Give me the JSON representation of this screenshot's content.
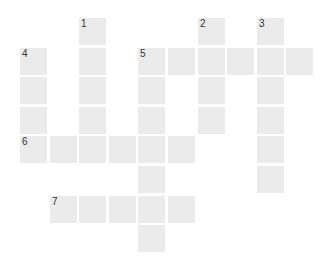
{
  "puzzle": {
    "type": "crossword",
    "origin": {
      "x": 20,
      "y": 18
    },
    "pitch": 29.6,
    "cell_color": "#ebebeb",
    "cells": [
      {
        "row": 0,
        "col": 2,
        "number": "1"
      },
      {
        "row": 0,
        "col": 6,
        "number": "2"
      },
      {
        "row": 0,
        "col": 8,
        "number": "3"
      },
      {
        "row": 1,
        "col": 0,
        "number": "4"
      },
      {
        "row": 1,
        "col": 2,
        "number": ""
      },
      {
        "row": 1,
        "col": 4,
        "number": "5"
      },
      {
        "row": 1,
        "col": 5,
        "number": ""
      },
      {
        "row": 1,
        "col": 6,
        "number": ""
      },
      {
        "row": 1,
        "col": 7,
        "number": ""
      },
      {
        "row": 1,
        "col": 8,
        "number": ""
      },
      {
        "row": 1,
        "col": 9,
        "number": ""
      },
      {
        "row": 2,
        "col": 0,
        "number": ""
      },
      {
        "row": 2,
        "col": 2,
        "number": ""
      },
      {
        "row": 2,
        "col": 4,
        "number": ""
      },
      {
        "row": 2,
        "col": 6,
        "number": ""
      },
      {
        "row": 2,
        "col": 8,
        "number": ""
      },
      {
        "row": 3,
        "col": 0,
        "number": ""
      },
      {
        "row": 3,
        "col": 2,
        "number": ""
      },
      {
        "row": 3,
        "col": 4,
        "number": ""
      },
      {
        "row": 3,
        "col": 6,
        "number": ""
      },
      {
        "row": 3,
        "col": 8,
        "number": ""
      },
      {
        "row": 4,
        "col": 0,
        "number": "6"
      },
      {
        "row": 4,
        "col": 1,
        "number": ""
      },
      {
        "row": 4,
        "col": 2,
        "number": ""
      },
      {
        "row": 4,
        "col": 3,
        "number": ""
      },
      {
        "row": 4,
        "col": 4,
        "number": ""
      },
      {
        "row": 4,
        "col": 5,
        "number": ""
      },
      {
        "row": 4,
        "col": 8,
        "number": ""
      },
      {
        "row": 5,
        "col": 4,
        "number": ""
      },
      {
        "row": 5,
        "col": 8,
        "number": ""
      },
      {
        "row": 6,
        "col": 1,
        "number": "7"
      },
      {
        "row": 6,
        "col": 2,
        "number": ""
      },
      {
        "row": 6,
        "col": 3,
        "number": ""
      },
      {
        "row": 6,
        "col": 4,
        "number": ""
      },
      {
        "row": 6,
        "col": 5,
        "number": ""
      },
      {
        "row": 7,
        "col": 4,
        "number": ""
      }
    ]
  }
}
